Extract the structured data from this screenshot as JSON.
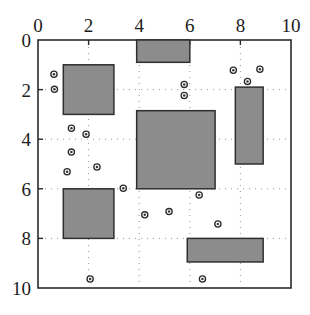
{
  "figure": {
    "title": "",
    "background_color": "#ffffff",
    "rect_fill_color": "#8c8c8c",
    "rect_stroke_color": "#2f2f2f",
    "axis_color": "#2b2b2b",
    "grid_color": "#8a8a8a"
  },
  "chart_data": {
    "type": "scatter",
    "title": "",
    "xlabel": "",
    "ylabel": "",
    "xlim": [
      0,
      10
    ],
    "ylim": [
      0,
      10
    ],
    "y_axis_inverted": true,
    "grid": true,
    "grid_style": "dotted",
    "legend": "none",
    "x_ticks": [
      0,
      2,
      4,
      6,
      8,
      10
    ],
    "y_ticks": [
      0,
      2,
      4,
      6,
      8,
      10
    ],
    "x_tick_labels": [
      "0",
      "2",
      "4",
      "6",
      "8",
      "10"
    ],
    "y_tick_labels": [
      "0",
      "2",
      "4",
      "6",
      "8",
      "10"
    ],
    "rectangles": [
      {
        "name": "rect-top-center",
        "x0": 3.9,
        "y0": 0.0,
        "x1": 6.0,
        "y1": 0.9
      },
      {
        "name": "rect-upper-left",
        "x0": 1.0,
        "y0": 1.0,
        "x1": 3.0,
        "y1": 3.0
      },
      {
        "name": "rect-center-large",
        "x0": 3.9,
        "y0": 2.85,
        "x1": 7.0,
        "y1": 6.0
      },
      {
        "name": "rect-right-tall",
        "x0": 7.8,
        "y0": 1.9,
        "x1": 8.9,
        "y1": 5.0
      },
      {
        "name": "rect-lower-left",
        "x0": 1.0,
        "y0": 6.0,
        "x1": 3.0,
        "y1": 8.0
      },
      {
        "name": "rect-bottom-right",
        "x0": 5.9,
        "y0": 8.0,
        "x1": 8.9,
        "y1": 8.95
      }
    ],
    "points": [
      {
        "x": 0.63,
        "y": 1.38
      },
      {
        "x": 0.65,
        "y": 1.99
      },
      {
        "x": 5.78,
        "y": 1.79
      },
      {
        "x": 5.78,
        "y": 2.24
      },
      {
        "x": 7.72,
        "y": 1.22
      },
      {
        "x": 8.77,
        "y": 1.18
      },
      {
        "x": 8.28,
        "y": 1.67
      },
      {
        "x": 1.32,
        "y": 3.56
      },
      {
        "x": 1.9,
        "y": 3.8
      },
      {
        "x": 1.32,
        "y": 4.52
      },
      {
        "x": 1.15,
        "y": 5.31
      },
      {
        "x": 2.33,
        "y": 5.12
      },
      {
        "x": 3.37,
        "y": 5.98
      },
      {
        "x": 6.37,
        "y": 6.25
      },
      {
        "x": 4.22,
        "y": 7.05
      },
      {
        "x": 5.18,
        "y": 6.92
      },
      {
        "x": 7.11,
        "y": 7.42
      },
      {
        "x": 2.06,
        "y": 9.64
      },
      {
        "x": 6.5,
        "y": 9.64
      }
    ],
    "values": [],
    "categories": []
  }
}
